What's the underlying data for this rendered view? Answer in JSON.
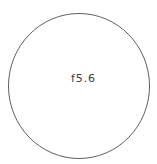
{
  "diagram": {
    "type": "aperture-circle-diagram",
    "label": "f5.6",
    "shape": {
      "name": "circle-outline",
      "center_x": 79,
      "center_y": 86,
      "radius_x": 71,
      "radius_y": 73,
      "stroke_color": "#5f5f5f",
      "stroke_width": 1,
      "fill_color": "#ffffff"
    },
    "background_color": "#ffffff",
    "label_color": "#3b3b3b"
  }
}
